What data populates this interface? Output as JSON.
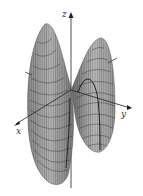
{
  "figure": {
    "type": "3d-surface",
    "axes": {
      "x": {
        "label": "x"
      },
      "y": {
        "label": "y"
      },
      "z": {
        "label": "z"
      }
    },
    "colors": {
      "background": "#ffffff",
      "surface_light": "#cfcfcf",
      "surface_mid": "#9a9a9a",
      "surface_dark": "#5a5a5a",
      "mesh_line": "#3a3a3a",
      "axis": "#222222",
      "label": "#333333"
    }
  }
}
